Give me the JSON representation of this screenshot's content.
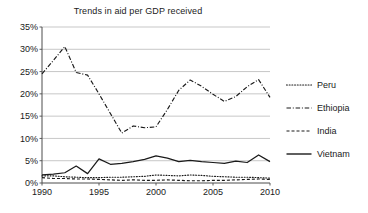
{
  "chart_data": {
    "type": "line",
    "title": "Trends in aid per GDP received",
    "xlabel": "",
    "ylabel": "",
    "xlim": [
      1990,
      2010
    ],
    "ylim": [
      0,
      35
    ],
    "grid": true,
    "legend_position": "right",
    "x": [
      1990,
      1991,
      1992,
      1993,
      1994,
      1995,
      1996,
      1997,
      1998,
      1999,
      2000,
      2001,
      2002,
      2003,
      2004,
      2005,
      2006,
      2007,
      2008,
      2009,
      2010
    ],
    "xticks": [
      "1990",
      "1995",
      "2000",
      "2005",
      "2010"
    ],
    "xtick_values": [
      1990,
      1995,
      2000,
      2005,
      2010
    ],
    "yticks": [
      "0%",
      "5%",
      "10%",
      "15%",
      "20%",
      "25%",
      "30%",
      "35%"
    ],
    "ytick_values": [
      0,
      5,
      10,
      15,
      20,
      25,
      30,
      35
    ],
    "series": [
      {
        "name": "Peru",
        "style": "dotted",
        "color": "#1a1a1a",
        "values": [
          1.6,
          1.6,
          1.4,
          1.3,
          1.2,
          1.2,
          1.3,
          1.3,
          1.4,
          1.5,
          1.8,
          1.7,
          1.6,
          1.8,
          1.7,
          1.5,
          1.4,
          1.3,
          1.3,
          1.2,
          1.1
        ]
      },
      {
        "name": "Ethiopia",
        "style": "dashdot",
        "color": "#1a1a1a",
        "values": [
          24.5,
          27.5,
          30.6,
          24.8,
          24.2,
          20.0,
          15.6,
          11.2,
          12.8,
          12.4,
          12.6,
          16.5,
          20.8,
          23.1,
          21.7,
          19.9,
          18.3,
          19.4,
          21.6,
          23.2,
          19.2
        ]
      },
      {
        "name": "India",
        "style": "dashed",
        "color": "#1a1a1a",
        "values": [
          1.2,
          1.0,
          1.0,
          0.9,
          0.9,
          0.8,
          0.7,
          0.6,
          0.7,
          0.6,
          0.6,
          0.7,
          0.6,
          0.5,
          0.5,
          0.6,
          0.6,
          0.7,
          0.8,
          0.9,
          0.8
        ]
      },
      {
        "name": "Vietnam",
        "style": "solid",
        "color": "#1a1a1a",
        "values": [
          1.8,
          2.0,
          2.3,
          3.8,
          2.1,
          5.4,
          4.2,
          4.4,
          4.8,
          5.3,
          6.1,
          5.6,
          4.8,
          5.1,
          4.8,
          4.6,
          4.4,
          4.9,
          4.6,
          6.3,
          4.8
        ]
      }
    ]
  },
  "legend": {
    "items": [
      {
        "label": "Peru",
        "style": "dotted"
      },
      {
        "label": "Ethiopia",
        "style": "dashdot"
      },
      {
        "label": "India",
        "style": "dashed"
      },
      {
        "label": "Vietnam",
        "style": "solid"
      }
    ]
  },
  "colors": {
    "ink": "#1a1a1a",
    "grid": "#b9b9b9",
    "axis": "#4d4d4d",
    "background": "#ffffff"
  }
}
